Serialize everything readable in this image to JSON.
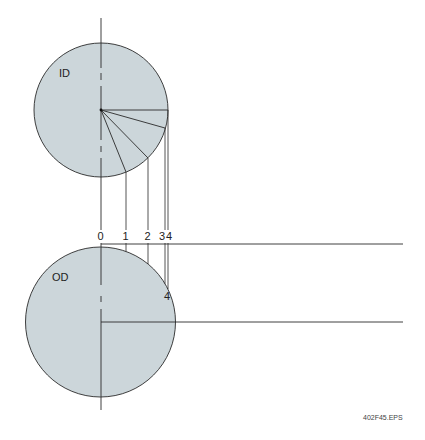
{
  "diagram": {
    "type": "projection-construction",
    "colors": {
      "fill": "#ccd6da",
      "stroke": "#2a2a2a",
      "background": "#ffffff"
    },
    "top_circle": {
      "label": "ID",
      "center": [
        101,
        110
      ],
      "radius": 67,
      "radial_divisions": [
        {
          "index": 0,
          "end": [
            101,
            177
          ]
        },
        {
          "index": 1,
          "end": [
            126,
            172
          ]
        },
        {
          "index": 2,
          "end": [
            148,
            158
          ]
        },
        {
          "index": 3,
          "end": [
            165,
            128
          ]
        },
        {
          "index": 4,
          "end": [
            168,
            110
          ]
        }
      ]
    },
    "bottom_circle": {
      "label": "OD",
      "center": [
        100.5,
        322
      ],
      "radius": 75,
      "point_label": "4"
    },
    "division_labels": [
      "0",
      "1",
      "2",
      "3",
      "4"
    ],
    "reference_lines": {
      "upper_y": 244,
      "lower_y": 322,
      "end_x": 403
    },
    "file_label": "402F45.EPS"
  }
}
